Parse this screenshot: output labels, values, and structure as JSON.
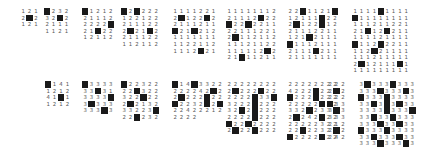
{
  "puzzles": [
    {
      "x": 20,
      "y": 8,
      "rows": [
        "121",
        "2M2",
        "121"
      ]
    },
    {
      "x": 44,
      "y": 8,
      "rows": [
        "M232",
        "32M2",
        "2111",
        "1121"
      ]
    },
    {
      "x": 82,
      "y": 8,
      "rows": [
        "M1212",
        "21112",
        "2222M",
        "21M22",
        "12112"
      ]
    },
    {
      "x": 121,
      "y": 8,
      "rows": [
        "M2M222",
        "122122",
        "211122",
        "2M21M2",
        "211122",
        "112112"
      ]
    },
    {
      "x": 172,
      "y": 8,
      "rows": [
        "1111221",
        "2M122M2",
        "2111211",
        "M21M212",
        "1111111",
        "1122112",
        "1112M21"
      ]
    },
    {
      "x": 226,
      "y": 8,
      "rows": [
        "11111112",
        "21112M22",
        "M22M2211",
        "22111221",
        "2M112112",
        "11121122",
        "111112M2",
        "21M11211"
      ]
    },
    {
      "x": 287,
      "y": 8,
      "rows": [
        "22M1121M",
        "12111M22",
        "2M122M12",
        "21112211",
        "121M2111",
        "M1112111",
        "2111M211",
        "21111111"
      ]
    },
    {
      "x": 352,
      "y": 8,
      "rows": [
        "1111M1111",
        "M11111111",
        "111211221",
        "21M12M211",
        "111121111",
        "M112M2211",
        "112M21111",
        "111211111",
        "2M12111M1",
        "111111111"
      ]
    },
    {
      "x": 45,
      "y": 81,
      "rows": [
        "M141",
        "1212",
        "41M1",
        "1212"
      ]
    },
    {
      "x": 82,
      "y": 81,
      "rows": [
        "M3333",
        "33M31",
        "3333M",
        "3M333",
        "333M3"
      ]
    },
    {
      "x": 121,
      "y": 81,
      "rows": [
        "M22322",
        "22M322",
        "322M22",
        "2M2132",
        "33223M",
        "22M232"
      ]
    },
    {
      "x": 172,
      "y": 81,
      "rows": [
        "M14M33",
        "222222",
        "42M22M",
        "222M22",
        "M2232M",
        "2M2242",
        "22122222"
      ]
    },
    {
      "x": 226,
      "y": 81,
      "rows": [
        "22222222",
        "2M222M22",
        "2222M33M",
        "3222M222",
        "32M2M222",
        "2222M222",
        "M22M2222",
        "2M22M222"
      ]
    },
    {
      "x": 287,
      "y": 81,
      "rows": [
        "22222222",
        "4222M222",
        "M222M222",
        "22222M22",
        "332M2332",
        "2M242M22",
        "22222322",
        "22M22322",
        "M2222M22"
      ]
    },
    {
      "x": 327,
      "y": 81,
      "rows": [
        "222",
        "2M2",
        "222",
        "M33",
        "3M3",
        "333",
        "212",
        "2M2",
        "242"
      ]
    },
    {
      "x": 358,
      "y": 81,
      "rows": [
        "3M333M333",
        "333M333M3",
        "M333M3333",
        "33M3M3M33",
        "3333M333M",
        "33M33M333",
        "333M33M33",
        "M333M3333",
        "33M333M33",
        "333M333M3"
      ]
    }
  ]
}
